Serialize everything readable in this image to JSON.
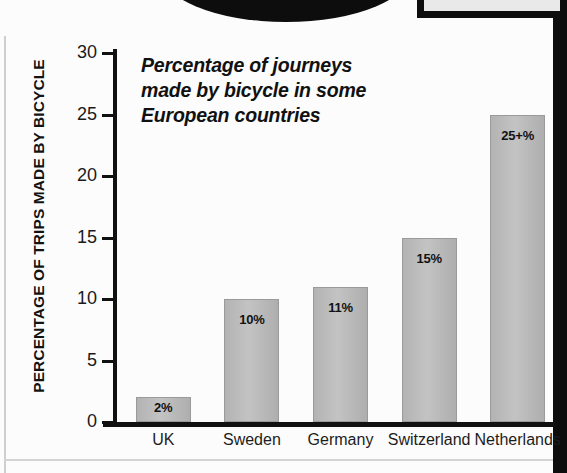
{
  "page": {
    "background_color": "#fcfcfc",
    "frame_color": "#0d0d0d"
  },
  "chart_data": {
    "type": "bar",
    "title": "Percentage of journeys made by bicycle in some European countries",
    "title_lines": [
      "Percentage of journeys",
      "made by bicycle in some",
      "European countries"
    ],
    "xlabel": "",
    "ylabel": "PERCENTAGE OF TRIPS MADE BY BICYCLE",
    "categories": [
      "UK",
      "Sweden",
      "Germany",
      "Switzerland",
      "Netherlands"
    ],
    "values": [
      2,
      10,
      11,
      15,
      25
    ],
    "data_labels": [
      "2%",
      "10%",
      "11%",
      "15%",
      "25+%"
    ],
    "ylim": [
      0,
      30
    ],
    "yticks": [
      0,
      5,
      10,
      15,
      20,
      25,
      30
    ],
    "ytick_labels": [
      "0",
      "5",
      "10",
      "15",
      "20",
      "25",
      "30"
    ],
    "grid": false,
    "legend": false,
    "bar_color": "#bdbdbd",
    "bar_border_color": "#9a9a9a",
    "axis_color": "#111111",
    "text_color": "#121212"
  }
}
